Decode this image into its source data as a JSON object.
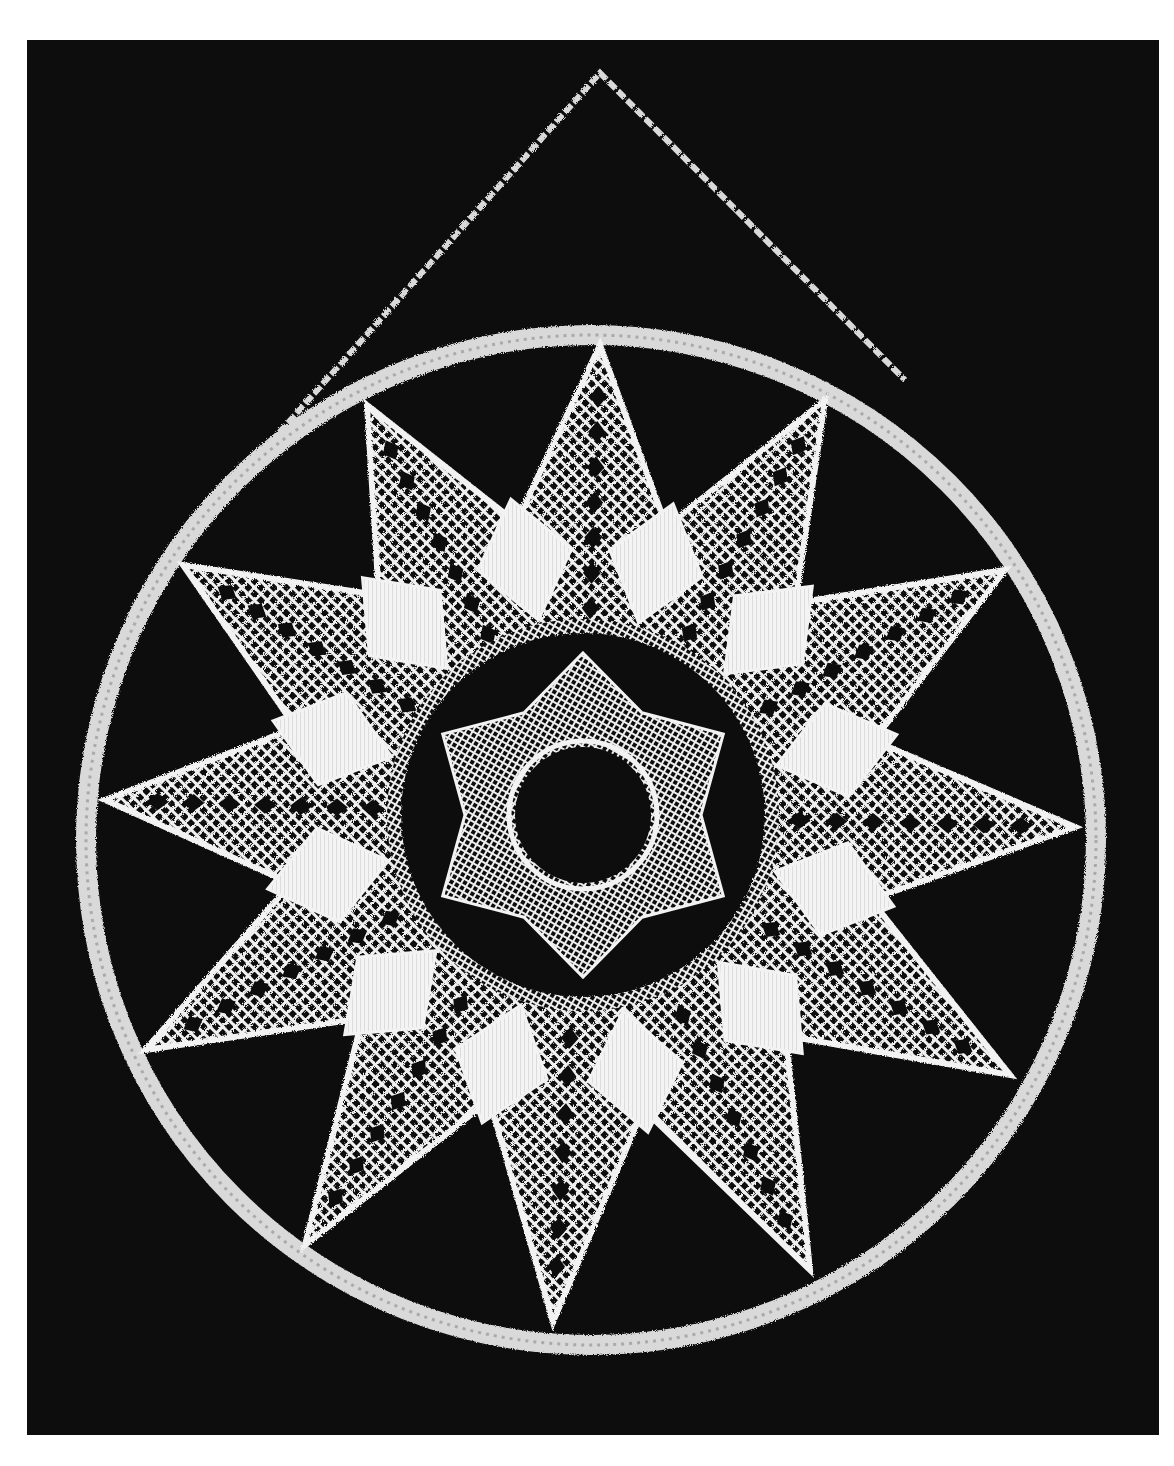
{
  "image": {
    "subject": "Twelve-pointed white bobbin-lace star mounted inside a circular ring, hung from a triangular cord, on a black background",
    "background_color": "#0d0d0d",
    "page_color": "#ffffff",
    "lace_color": "#f2f2f2",
    "ring_color": "#d9d9d9"
  },
  "frame": {
    "x": 27,
    "y": 40,
    "width": 1132,
    "height": 1395
  },
  "hanging_cord": {
    "apex": [
      600,
      73
    ],
    "left_end": [
      262,
      452
    ],
    "right_end": [
      905,
      380
    ]
  },
  "ring": {
    "cx": 591,
    "cy": 840,
    "r": 505,
    "stroke_width": 20
  },
  "star": {
    "center": [
      583,
      815
    ],
    "point_count": 12,
    "points": [
      [
        600,
        345
      ],
      [
        825,
        400
      ],
      [
        1005,
        570
      ],
      [
        1075,
        827
      ],
      [
        1010,
        1075
      ],
      [
        810,
        1270
      ],
      [
        553,
        1322
      ],
      [
        305,
        1245
      ],
      [
        145,
        1050
      ],
      [
        105,
        800
      ],
      [
        183,
        565
      ],
      [
        367,
        405
      ]
    ],
    "valley_radius": 300,
    "panel_radius": 262
  },
  "center_medallion": {
    "outer_dark_radius": 182,
    "inner_star_points": 6,
    "inner_star_radius": 162,
    "inner_star_valley": 118,
    "hole_radius": 68
  }
}
